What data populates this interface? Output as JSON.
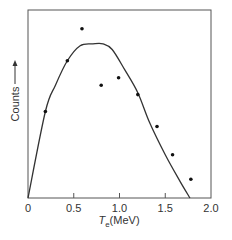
{
  "chart_data": {
    "type": "scatter",
    "title": "",
    "xlabel": "T_e(MeV)",
    "xlabel_main": "T",
    "xlabel_sub": "e",
    "xlabel_unit": "(MeV)",
    "ylabel": "Counts",
    "xlim": [
      0,
      2.0
    ],
    "ylim": [
      0,
      100
    ],
    "x_ticks": [
      0,
      0.5,
      1.0,
      1.5,
      2.0
    ],
    "x_tick_labels": [
      "0",
      "0.5",
      "1.0",
      "1.5",
      "2.0"
    ],
    "y_ticks": [],
    "grid": false,
    "legend": null,
    "series": [
      {
        "name": "Measured counts",
        "kind": "scatter",
        "x": [
          0.19,
          0.43,
          0.59,
          0.8,
          0.99,
          1.2,
          1.41,
          1.58,
          1.78
        ],
        "y": [
          46,
          73,
          90,
          60,
          64,
          55,
          38,
          23,
          10
        ]
      },
      {
        "name": "Theoretical spectrum",
        "kind": "line",
        "x": [
          0,
          0.19,
          0.3,
          0.43,
          0.57,
          0.71,
          0.82,
          0.92,
          1.06,
          1.2,
          1.33,
          1.5,
          1.66,
          1.77
        ],
        "y": [
          0,
          46,
          60,
          73,
          81,
          82,
          82,
          79,
          68,
          56,
          40,
          23,
          9,
          0
        ]
      }
    ]
  },
  "labels": {
    "ylabel": "Counts",
    "ylabel_arrow": "→",
    "xlabel_main": "T",
    "xlabel_sub": "e",
    "xlabel_unit": "(MeV)",
    "x_ticks": [
      "0",
      "0.5",
      "1.0",
      "1.5",
      "2.0"
    ]
  }
}
